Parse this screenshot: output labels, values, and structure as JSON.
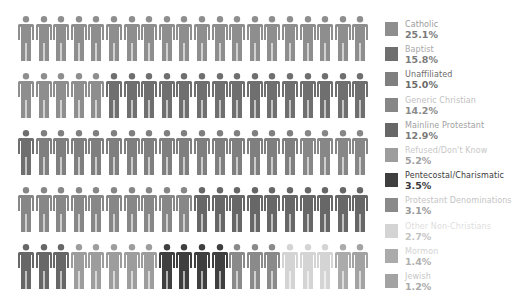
{
  "chart_data": {
    "type": "pictogram",
    "title": "",
    "unit": "1 figure = 1% (100 figures, 5 rows x 20)",
    "layout": {
      "rows": 5,
      "per_row": 20,
      "legend_position": "right"
    },
    "categories": [
      {
        "name": "Catholic",
        "value": 25.1,
        "label": "25.1%",
        "figures": 25,
        "color": "#8e8e8e",
        "label_color": "#9a9a9a",
        "value_color": "#7a7a7a"
      },
      {
        "name": "Baptist",
        "value": 15.8,
        "label": "15.8%",
        "figures": 16,
        "color": "#6f6f6f",
        "label_color": "#a8a8a8",
        "value_color": "#7a7a7a"
      },
      {
        "name": "Unaffiliated",
        "value": 15.0,
        "label": "15.0%",
        "figures": 15,
        "color": "#7f7f7f",
        "label_color": "#6a6a6a",
        "value_color": "#6a6a6a"
      },
      {
        "name": "Generic Christian",
        "value": 14.2,
        "label": "14.2%",
        "figures": 14,
        "color": "#878787",
        "label_color": "#c0c0c0",
        "value_color": "#8a8a8a"
      },
      {
        "name": "Mainline Protestant",
        "value": 12.9,
        "label": "12.9%",
        "figures": 13,
        "color": "#676767",
        "label_color": "#a0a0a0",
        "value_color": "#7a7a7a"
      },
      {
        "name": "Refused/Don't Know",
        "value": 5.2,
        "label": "5.2%",
        "figures": 5,
        "color": "#9d9d9d",
        "label_color": "#c8c8c8",
        "value_color": "#a0a0a0"
      },
      {
        "name": "Pentecostal/Charismatic",
        "value": 3.5,
        "label": "3.5%",
        "figures": 4,
        "color": "#3f3f3f",
        "label_color": "#3a3a3a",
        "value_color": "#3a3a3a"
      },
      {
        "name": "Protestant Denominations",
        "value": 3.1,
        "label": "3.1%",
        "figures": 3,
        "color": "#8a8a8a",
        "label_color": "#c4c4c4",
        "value_color": "#9a9a9a"
      },
      {
        "name": "Other Non-Christians",
        "value": 2.7,
        "label": "2.7%",
        "figures": 3,
        "color": "#d4d4d4",
        "label_color": "#dedede",
        "value_color": "#c4c4c4"
      },
      {
        "name": "Mormon",
        "value": 1.4,
        "label": "1.4%",
        "figures": 1,
        "color": "#ababab",
        "label_color": "#d2d2d2",
        "value_color": "#b0b0b0"
      },
      {
        "name": "Jewish",
        "value": 1.2,
        "label": "1.2%",
        "figures": 1,
        "color": "#a3a3a3",
        "label_color": "#c6c6c6",
        "value_color": "#aaaaaa"
      }
    ]
  }
}
